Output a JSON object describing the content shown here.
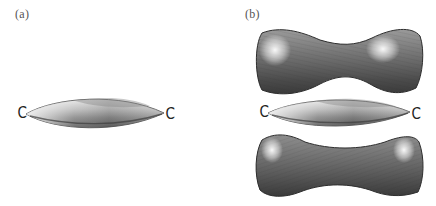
{
  "figure": {
    "panels": [
      {
        "label": "(a)",
        "description": "Single spindle-shaped muscle (fusiform) with tendon attachment hooks at each end",
        "left_marker": "C",
        "right_marker": "C"
      },
      {
        "label": "(b)",
        "description": "Same spindle-shaped muscle placed between two bone-like shaped masses (upper and lower)",
        "left_marker": "C",
        "right_marker": "C"
      }
    ],
    "colors": {
      "background": "#ffffff",
      "shading_dark": "#3a3a3a",
      "shading_mid": "#8a8a8a",
      "highlight": "#f2f2f2",
      "marker": "#222222"
    }
  }
}
